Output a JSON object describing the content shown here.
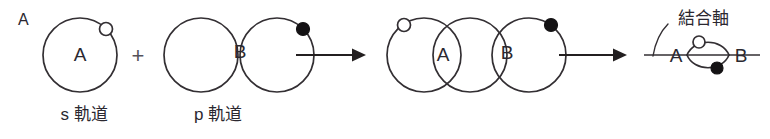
{
  "diagram": {
    "title_label": "A",
    "plus_label": "+",
    "left_group": {
      "orbital_letter": "A",
      "caption": "s 軌道",
      "electron_marker": "open-circle"
    },
    "right_group": {
      "orbital_letter": "B",
      "caption": "p 軌道",
      "electron_marker": "filled-circle"
    },
    "arrow1": {
      "name": "reaction-arrow",
      "glyph": "→"
    },
    "middle_group": {
      "atom_a_letter": "A",
      "atom_b_letter": "B"
    },
    "arrow2": {
      "name": "reaction-arrow",
      "glyph": "→"
    },
    "result_group": {
      "annotation": "結合軸",
      "atom_left": "A",
      "atom_right": "B",
      "marker_open": "open-circle",
      "marker_filled": "filled-circle"
    },
    "colors": {
      "ink": "#332f33",
      "ink_dark": "#141214",
      "text": "#2b2830",
      "background": "#ffffff"
    }
  }
}
